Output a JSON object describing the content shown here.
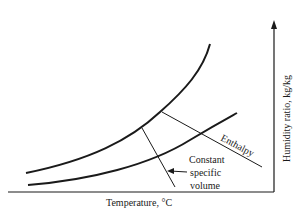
{
  "diagram": {
    "type": "psychrometric-schematic",
    "x_axis_label": "Temperature, °C",
    "y_axis_label": "Humidity ratio, kg/kg",
    "annotations": {
      "enthalpy": "Enthalpy",
      "volume_line1": "Constant",
      "volume_line2": "specific",
      "volume_line3": "volume"
    },
    "colors": {
      "ink": "#1a1a1a",
      "background": "#ffffff"
    }
  }
}
